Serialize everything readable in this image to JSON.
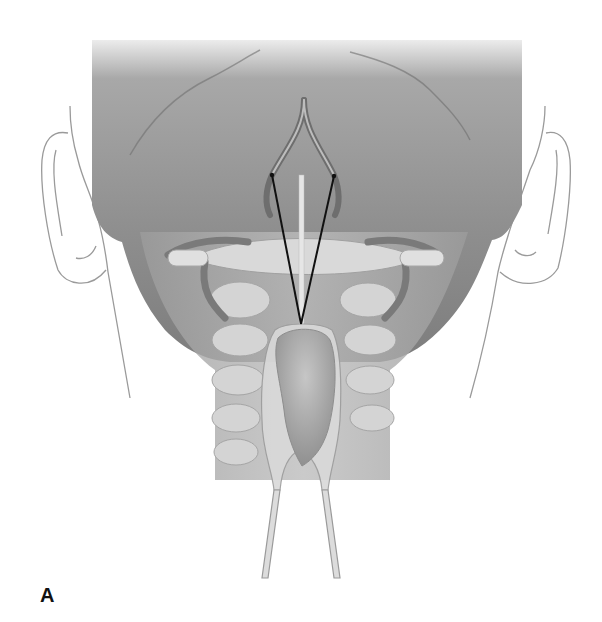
{
  "figure": {
    "panel_label": "A",
    "colors": {
      "background": "#ffffff",
      "skull": "#8f8f8f",
      "skull_light": "#b5b5b5",
      "outline": "#9a9a9a",
      "vessel": "#777777",
      "bone": "#cfcfcf",
      "retractor": "#d8d8d8",
      "pointer_lines": "#111111"
    }
  }
}
